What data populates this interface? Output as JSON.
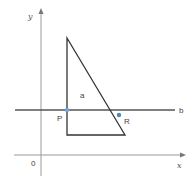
{
  "diagram": {
    "axes": {
      "x_label": "x",
      "y_label": "y",
      "origin_label": "0",
      "color": "#9a9a9a"
    },
    "line_b": {
      "label": "b",
      "color": "#555555"
    },
    "triangle": {
      "label": "a",
      "color": "#333333",
      "vertices": [
        [
          67,
          38
        ],
        [
          67,
          135
        ],
        [
          125,
          135
        ]
      ]
    },
    "points": [
      {
        "label": "P",
        "x": 67,
        "y": 110,
        "color": "#6fa8dc"
      },
      {
        "label": "R",
        "x": 119,
        "y": 115,
        "color": "#4a86b8"
      }
    ]
  }
}
